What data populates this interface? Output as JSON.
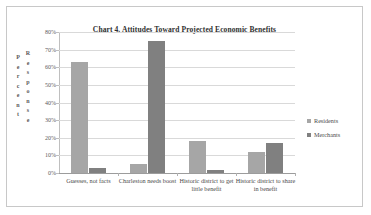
{
  "chart_data": {
    "type": "bar",
    "title": "Chart 4.  Attitudes Toward Projected Economic Benefits",
    "xlabel": "",
    "ylabel": "Percent Response",
    "ylabel_parts": [
      "Percent",
      "Response"
    ],
    "categories": [
      "Guesses, not facts",
      "Charleston needs boost",
      "Historic district to get little benefit",
      "Historic district to share in benefit"
    ],
    "series": [
      {
        "name": "Residents",
        "color": "#a6a6a6",
        "values": [
          63,
          5,
          18,
          12
        ]
      },
      {
        "name": "Merchants",
        "color": "#808080",
        "values": [
          3,
          75,
          1.5,
          17
        ]
      }
    ],
    "ylim": [
      0,
      80
    ],
    "ytick_values": [
      0,
      10,
      20,
      30,
      40,
      50,
      60,
      70,
      80
    ],
    "ytick_labels": [
      "0%",
      "10%",
      "20%",
      "30%",
      "40%",
      "50%",
      "60%",
      "70%",
      "80%"
    ],
    "grid": "horizontal",
    "legend_position": "right"
  },
  "axis": {
    "y_title_line1": "Percent",
    "y_title_line2": "Response"
  },
  "legend": {
    "items": [
      {
        "label": "Residents"
      },
      {
        "label": "Merchants"
      }
    ]
  },
  "colors": {
    "residents": "#a6a6a6",
    "merchants": "#808080",
    "gridline": "#d9d9d9",
    "border": "#c8c8c8",
    "text": "#4a4a4a"
  }
}
